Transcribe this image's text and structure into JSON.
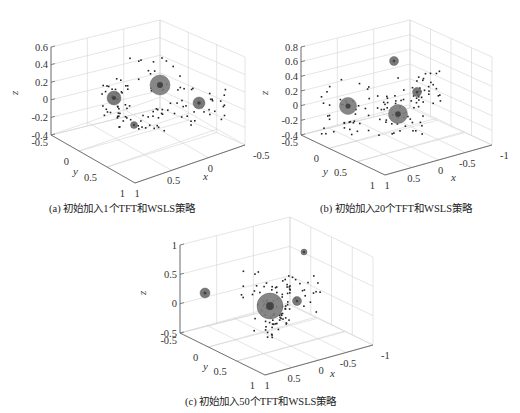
{
  "figure": {
    "captions": [
      "(a) 初始加入1个TFT和WSLS策略",
      "(b) 初始加入20个TFT和WSLS策略",
      "(c) 初始加入50个TFT和WSLS策略"
    ]
  },
  "chart_data": [
    {
      "type": "scatter",
      "panel": "a",
      "title": "(a) 初始加入1个TFT和WSLS策略",
      "xlabel": "x",
      "ylabel": "y",
      "zlabel": "z",
      "x_ticks": [
        "-0.5",
        "0",
        "0.5",
        "1"
      ],
      "y_ticks": [
        "-0.5",
        "0",
        "0.5",
        "1"
      ],
      "z_ticks": [
        "0.6",
        "0.4",
        "0.2",
        "0",
        "-0.2",
        "-0.4"
      ],
      "zlim": [
        -0.4,
        0.6
      ],
      "grid": true,
      "clusters": [
        {
          "size": "large",
          "screen": [
            160,
            85
          ],
          "r": 10
        },
        {
          "size": "medium",
          "screen": [
            114,
            98
          ],
          "r": 7
        },
        {
          "size": "medium",
          "screen": [
            199,
            103
          ],
          "r": 6
        },
        {
          "size": "small",
          "screen": [
            134,
            125
          ],
          "r": 3.5
        }
      ]
    },
    {
      "type": "scatter",
      "panel": "b",
      "title": "(b) 初始加入20个TFT和WSLS策略",
      "xlabel": "x",
      "ylabel": "y",
      "zlabel": "z",
      "x_ticks": [
        "-1",
        "-0.5",
        "0",
        "0.5",
        "1"
      ],
      "y_ticks": [
        "-0.5",
        "0",
        "0.5",
        "1"
      ],
      "z_ticks": [
        "0.8",
        "0.6",
        "0.4",
        "0.2",
        "0",
        "-0.2",
        "-0.4"
      ],
      "zlim": [
        -0.4,
        0.8
      ],
      "grid": true,
      "clusters": [
        {
          "size": "large",
          "screen": [
            398,
            114
          ],
          "r": 9.5
        },
        {
          "size": "large",
          "screen": [
            348,
            106
          ],
          "r": 8.5
        },
        {
          "size": "small",
          "screen": [
            394,
            61
          ],
          "r": 4.5
        },
        {
          "size": "small",
          "screen": [
            417,
            92
          ],
          "r": 4.5
        }
      ]
    },
    {
      "type": "scatter",
      "panel": "c",
      "title": "(c) 初始加入50个TFT和WSLS策略",
      "xlabel": "x",
      "ylabel": "y",
      "zlabel": "z",
      "x_ticks": [
        "-1",
        "-0.5",
        "0",
        "0.5",
        "1"
      ],
      "y_ticks": [
        "-0.5",
        "0",
        "0.5",
        "1"
      ],
      "z_ticks": [
        "1",
        "0.5",
        "0",
        "-0.5"
      ],
      "zlim": [
        -0.5,
        1
      ],
      "grid": true,
      "clusters": [
        {
          "size": "large",
          "screen": [
            270,
            306
          ],
          "r": 13
        },
        {
          "size": "medium",
          "screen": [
            205,
            293
          ],
          "r": 5
        },
        {
          "size": "small",
          "screen": [
            297,
            301
          ],
          "r": 4.5
        },
        {
          "size": "small",
          "screen": [
            304,
            252
          ],
          "r": 3
        }
      ]
    }
  ]
}
